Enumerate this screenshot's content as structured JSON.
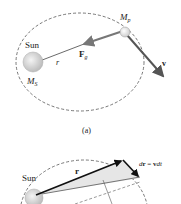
{
  "figure_a": {
    "sun_label": "Sun",
    "sun_mass_label": "M",
    "sun_mass_sub": "S",
    "planet_mass_label": "M",
    "planet_mass_sub": "p",
    "radius_label": "r",
    "force_label": "F",
    "force_sub": "g",
    "velocity_label": "v",
    "caption": "(a)"
  },
  "figure_b": {
    "sun_label": "Sun",
    "radius_vector_label": "r",
    "displacement_label_d": "d",
    "displacement_label_r": "r",
    "displacement_label_eq": " = ",
    "displacement_label_v": "v",
    "displacement_label_dt": "dt"
  },
  "colors": {
    "orbit": "#555555",
    "sun_fill": "#d6d6d6",
    "planet_fill": "#ebebeb",
    "force_arrow": "#777777",
    "velocity_arrow": "#555555",
    "radius_line": "#444444",
    "sector_fill": "#e6e6e6",
    "vector_dark": "#111111"
  }
}
